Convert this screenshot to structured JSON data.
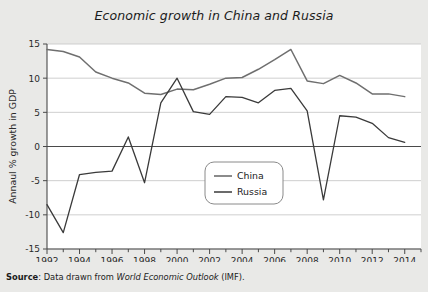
{
  "chart_data": {
    "type": "line",
    "title": "Economic growth in China and Russia",
    "xlabel": "",
    "ylabel": "Annaul % growth in GDP",
    "x": [
      1992,
      1993,
      1994,
      1995,
      1996,
      1997,
      1998,
      1999,
      2000,
      2001,
      2002,
      2003,
      2004,
      2005,
      2006,
      2007,
      2008,
      2009,
      2010,
      2011,
      2012,
      2013,
      2014
    ],
    "xlim": [
      1992,
      2015
    ],
    "ylim": [
      -15,
      15
    ],
    "yticks": [
      -15,
      -10,
      -5,
      0,
      5,
      10,
      15
    ],
    "xticks": [
      1992,
      1994,
      1996,
      1998,
      2000,
      2002,
      2004,
      2006,
      2008,
      2010,
      2012,
      2014
    ],
    "xtick_labels": [
      "1992",
      "1994",
      "1996",
      "1998",
      "2000",
      "2002",
      "2004",
      "2006",
      "2008",
      "2010",
      "2012",
      "2014"
    ],
    "ytick_labels": [
      "-15",
      "-10",
      "-5",
      "0",
      "5",
      "10",
      "15"
    ],
    "grid": true,
    "legend_position": "center",
    "series": [
      {
        "name": "China",
        "color": "#6f6f6f",
        "values": [
          14.2,
          13.9,
          13.1,
          10.9,
          10.0,
          9.3,
          7.8,
          7.6,
          8.4,
          8.3,
          9.1,
          10.0,
          10.1,
          11.3,
          12.7,
          14.2,
          9.6,
          9.2,
          10.4,
          9.3,
          7.7,
          7.7,
          7.3
        ]
      },
      {
        "name": "Russia",
        "color": "#3a3a3a",
        "values": [
          -8.5,
          -12.6,
          -4.1,
          -3.8,
          -3.6,
          1.4,
          -5.3,
          6.4,
          10.0,
          5.1,
          4.7,
          7.3,
          7.2,
          6.4,
          8.2,
          8.5,
          5.2,
          -7.8,
          4.5,
          4.3,
          3.4,
          1.3,
          0.6
        ]
      }
    ]
  },
  "source": {
    "label": "Source",
    "separator": ": ",
    "text_before": "Data drawn from ",
    "italic_text": "World Economic Outlook",
    "text_after": " (IMF)."
  },
  "legend": {
    "items": [
      {
        "label": "China"
      },
      {
        "label": "Russia"
      }
    ]
  }
}
